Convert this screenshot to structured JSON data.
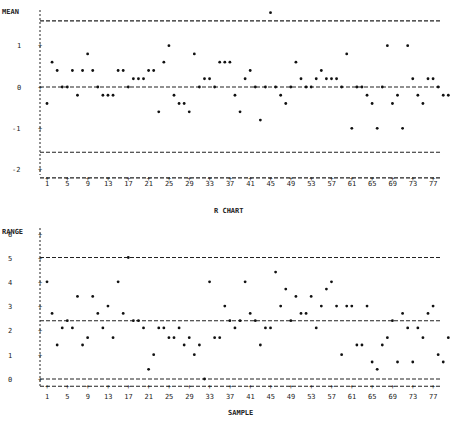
{
  "chart_data": [
    {
      "type": "scatter",
      "title": "",
      "ylabel": "MEAN",
      "xlabel": "",
      "ylim": [
        -2.2,
        1.9
      ],
      "yticks": [
        "1",
        "0",
        "-1",
        "-2"
      ],
      "xticks": [
        "1",
        "5",
        "9",
        "13",
        "17",
        "21",
        "25",
        "29",
        "33",
        "37",
        "41",
        "45",
        "49",
        "53",
        "57",
        "61",
        "65",
        "69",
        "73",
        "77"
      ],
      "control_lines": {
        "ucl": 1.6,
        "center": 0,
        "lcl": -1.58,
        "baseline": -2.2
      },
      "x": [
        1,
        2,
        3,
        4,
        5,
        6,
        7,
        8,
        9,
        10,
        11,
        12,
        13,
        14,
        15,
        16,
        17,
        18,
        19,
        20,
        21,
        22,
        23,
        24,
        25,
        26,
        27,
        28,
        29,
        30,
        31,
        32,
        33,
        34,
        35,
        36,
        37,
        38,
        39,
        40,
        41,
        42,
        43,
        44,
        45,
        46,
        47,
        48,
        49,
        50,
        51,
        52,
        53,
        54,
        55,
        56,
        57,
        58,
        59,
        60,
        61,
        62,
        63,
        64,
        65,
        66,
        67,
        68,
        69,
        70,
        71,
        72,
        73,
        74,
        75,
        76,
        77,
        78,
        79,
        80
      ],
      "values": [
        -0.4,
        0.6,
        0.4,
        0.0,
        0.0,
        0.4,
        -0.2,
        0.4,
        0.8,
        0.4,
        0.0,
        -0.2,
        -0.2,
        -0.2,
        0.4,
        0.4,
        0.0,
        0.2,
        0.2,
        0.2,
        0.4,
        0.4,
        -0.6,
        0.6,
        1.0,
        -0.2,
        -0.4,
        -0.4,
        -0.6,
        0.8,
        0.0,
        0.2,
        0.2,
        0.0,
        0.6,
        0.6,
        0.6,
        -0.2,
        -0.6,
        0.2,
        0.4,
        0.0,
        -0.8,
        0.0,
        1.8,
        0.0,
        -0.2,
        -0.4,
        0.0,
        0.6,
        0.2,
        0.0,
        0.0,
        0.2,
        0.4,
        0.2,
        0.2,
        0.2,
        0.0,
        0.8,
        -1.0,
        0.0,
        0.0,
        -0.2,
        -0.4,
        -1.0,
        0.0,
        1.0,
        -0.4,
        -0.2,
        -1.0,
        1.0,
        0.2,
        -0.2,
        -0.4,
        0.2,
        0.2,
        0.0,
        -0.2,
        -0.2
      ]
    },
    {
      "type": "scatter",
      "title": "R CHART",
      "ylabel": "RANGE",
      "xlabel": "SAMPLE",
      "ylim": [
        -0.3,
        6
      ],
      "yticks": [
        "6",
        "5",
        "4",
        "3",
        "2",
        "1",
        "0"
      ],
      "xticks": [
        "1",
        "5",
        "9",
        "13",
        "17",
        "21",
        "25",
        "29",
        "33",
        "37",
        "41",
        "45",
        "49",
        "53",
        "57",
        "61",
        "65",
        "69",
        "73",
        "77"
      ],
      "control_lines": {
        "ucl": 5.0,
        "center": 2.4,
        "lcl": 0.0,
        "baseline": -0.3
      },
      "x": [
        1,
        2,
        3,
        4,
        5,
        6,
        7,
        8,
        9,
        10,
        11,
        12,
        13,
        14,
        15,
        16,
        17,
        18,
        19,
        20,
        21,
        22,
        23,
        24,
        25,
        26,
        27,
        28,
        29,
        30,
        31,
        32,
        33,
        34,
        35,
        36,
        37,
        38,
        39,
        40,
        41,
        42,
        43,
        44,
        45,
        46,
        47,
        48,
        49,
        50,
        51,
        52,
        53,
        54,
        55,
        56,
        57,
        58,
        59,
        60,
        61,
        62,
        63,
        64,
        65,
        66,
        67,
        68,
        69,
        70,
        71,
        72,
        73,
        74,
        75,
        76,
        77,
        78,
        79,
        80
      ],
      "values": [
        4.0,
        2.7,
        1.4,
        2.1,
        2.4,
        2.1,
        3.4,
        1.4,
        1.7,
        3.4,
        2.7,
        2.1,
        3.0,
        1.7,
        4.0,
        2.7,
        5.0,
        2.4,
        2.4,
        2.1,
        0.4,
        1.0,
        2.1,
        2.1,
        1.7,
        1.7,
        2.1,
        1.4,
        1.7,
        1.0,
        1.4,
        0.0,
        4.0,
        1.7,
        1.7,
        3.0,
        2.4,
        2.1,
        2.4,
        4.0,
        2.7,
        2.4,
        1.4,
        2.1,
        2.1,
        4.4,
        3.0,
        3.7,
        2.4,
        3.4,
        2.7,
        2.7,
        3.4,
        2.1,
        3.0,
        3.7,
        4.0,
        3.0,
        1.0,
        3.0,
        3.0,
        1.4,
        1.4,
        3.0,
        0.7,
        0.4,
        1.4,
        1.7,
        2.4,
        0.7,
        2.7,
        2.1,
        0.7,
        2.1,
        1.7,
        2.7,
        3.0,
        1.0,
        0.7,
        1.7
      ]
    }
  ],
  "labels": {
    "top_ylabel": "MEAN",
    "bottom_title": "R CHART",
    "bottom_ylabel": "RANGE",
    "bottom_xlabel": "SAMPLE"
  }
}
